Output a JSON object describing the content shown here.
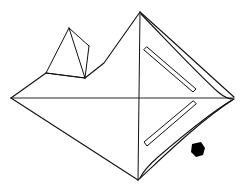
{
  "document": {
    "title": "Isometric Line Drawing",
    "kind": "technical-line-sketch",
    "canvas": {
      "width": 240,
      "height": 196,
      "background": "#ffffff"
    },
    "ink_color": "#111111",
    "fill_color": "#000000"
  },
  "figure": {
    "name": "diamond-solid-with-pyramid-and-slots",
    "vertices": {
      "left": {
        "label": "left-vertex",
        "x": 11,
        "y": 98
      },
      "top": {
        "label": "top-vertex",
        "x": 140,
        "y": 12
      },
      "right": {
        "label": "right-vertex",
        "x": 234,
        "y": 98
      },
      "bottom": {
        "label": "bottom-vertex",
        "x": 138,
        "y": 180
      }
    },
    "outline_paths": [
      {
        "name": "upper-left-edge",
        "stroke_width": 1.1,
        "d": "M 11 98 L 46 73 L 85 78 L 104 63 L 140 12"
      },
      {
        "name": "lower-left-edge",
        "stroke_width": 1.1,
        "d": "M 11 98 L 138 180"
      },
      {
        "name": "upper-right-edge-outer",
        "stroke_width": 1.1,
        "d": "M 140 12 C 176 44, 206 72, 234 97"
      },
      {
        "name": "upper-right-edge-inner",
        "stroke_width": 1.1,
        "d": "M 141 14 C 172 46, 198 74, 218 92 C 224 97, 229 99, 233 99"
      },
      {
        "name": "lower-right-edge-outer",
        "stroke_width": 1.1,
        "d": "M 138 180 C 160 160, 198 122, 234 99"
      },
      {
        "name": "lower-right-edge-inner",
        "stroke_width": 1.1,
        "d": "M 140 178 C 144 170, 150 164, 158 157 C 186 133, 212 112, 232 100"
      },
      {
        "name": "horizontal-axis-line",
        "stroke_width": 0.9,
        "d": "M 11 98 L 234 98"
      },
      {
        "name": "vertical-axis-line",
        "stroke_width": 1.0,
        "d": "M 140 12 L 138 180"
      }
    ],
    "pyramid": {
      "name": "upper-left-tetrahedron",
      "stroke_width": 1.0,
      "paths": [
        {
          "name": "pyramid-left-face-edge",
          "d": "M 69 28 L 46 73"
        },
        {
          "name": "pyramid-front-edge",
          "d": "M 69 28 L 85 78"
        },
        {
          "name": "pyramid-back-edge",
          "d": "M 69 28 L 89 46"
        },
        {
          "name": "pyramid-right-fold-edge",
          "d": "M 89 46 L 85 78"
        },
        {
          "name": "pyramid-base-edge",
          "d": "M 46 73 L 85 78"
        }
      ]
    },
    "slots": [
      {
        "name": "upper-slot",
        "stroke_width": 1.0,
        "d": "M 147 47 L 196 89 L 193 92 L 144 50 Z"
      },
      {
        "name": "lower-slot",
        "stroke_width": 1.0,
        "d": "M 196 104 L 147 146 L 144 142 L 193 101 Z"
      }
    ],
    "marker": {
      "name": "solid-arrow-marker",
      "fill": "#000000",
      "d": "M 192 144 L 201 142 L 205 148 L 203 155 L 196 157 L 191 152 Z"
    }
  }
}
